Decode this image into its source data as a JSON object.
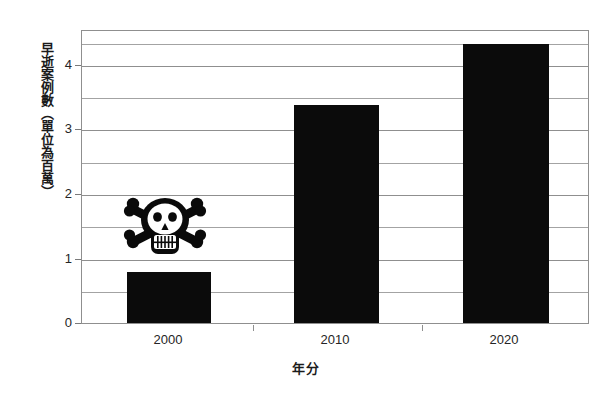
{
  "chart_data": {
    "type": "bar",
    "title": "",
    "subtitle": "",
    "categories": [
      "2000",
      "2010",
      "2020"
    ],
    "values": [
      0.8,
      3.4,
      4.35
    ],
    "series": [
      {
        "name": "早逝案例數",
        "values": [
          0.8,
          3.4,
          4.35
        ]
      }
    ],
    "xlabel": "年分",
    "ylabel": "早逝案例數（單位為百萬）",
    "ylim": [
      0,
      4.56
    ],
    "xlim": [
      0,
      3
    ],
    "y_ticks": [
      0,
      1,
      2,
      3,
      4
    ],
    "y_tick_labels": [
      "0",
      "1",
      "2",
      "3",
      "4"
    ],
    "y_minor_ticks": [
      0.5,
      1.5,
      2.5,
      3.5,
      4.5
    ],
    "grid": true,
    "grid_axis": "y",
    "legend": false,
    "legend_position": "none",
    "bar_color": "#0b0b0b",
    "grid_color": "#a3a3a3",
    "axis_color": "#8f8f8f",
    "background_color": "#ffffff",
    "annotations": [
      {
        "name": "skull-and-crossbones",
        "icon": "skull-crossbones-icon",
        "at_category": "2000",
        "at_value": 1.55,
        "description": "黑色骷髏頭與交叉骨圖示"
      }
    ]
  },
  "axes": {
    "y_title": "早逝案例數（單位為百萬）",
    "x_title": "年分",
    "y_labels": [
      "4",
      "3",
      "2",
      "1",
      "0"
    ],
    "x_labels": [
      "2000",
      "2010",
      "2020"
    ]
  }
}
